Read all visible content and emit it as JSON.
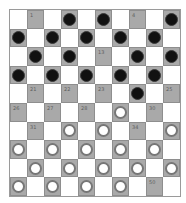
{
  "board": {
    "size": 10,
    "colors": {
      "light": "#ffffff",
      "dark": "#a9a9a9",
      "black_piece": "#111111",
      "white_piece": "#ffffff"
    },
    "squares": [
      {
        "n": 1,
        "piece": null
      },
      {
        "n": 2,
        "piece": "black"
      },
      {
        "n": 3,
        "piece": "black"
      },
      {
        "n": 4,
        "piece": null
      },
      {
        "n": 5,
        "piece": "black"
      },
      {
        "n": 6,
        "piece": "black"
      },
      {
        "n": 7,
        "piece": "black"
      },
      {
        "n": 8,
        "piece": "black"
      },
      {
        "n": 9,
        "piece": "black"
      },
      {
        "n": 10,
        "piece": "black"
      },
      {
        "n": 11,
        "piece": "black"
      },
      {
        "n": 12,
        "piece": "black"
      },
      {
        "n": 13,
        "piece": null
      },
      {
        "n": 14,
        "piece": "black"
      },
      {
        "n": 15,
        "piece": "black"
      },
      {
        "n": 16,
        "piece": "black"
      },
      {
        "n": 17,
        "piece": "black"
      },
      {
        "n": 18,
        "piece": "black"
      },
      {
        "n": 19,
        "piece": "black"
      },
      {
        "n": 20,
        "piece": "black"
      },
      {
        "n": 21,
        "piece": null
      },
      {
        "n": 22,
        "piece": null
      },
      {
        "n": 23,
        "piece": null
      },
      {
        "n": 24,
        "piece": "black"
      },
      {
        "n": 25,
        "piece": null
      },
      {
        "n": 26,
        "piece": null
      },
      {
        "n": 27,
        "piece": null
      },
      {
        "n": 28,
        "piece": null
      },
      {
        "n": 29,
        "piece": "white"
      },
      {
        "n": 30,
        "piece": null
      },
      {
        "n": 31,
        "piece": null
      },
      {
        "n": 32,
        "piece": "white"
      },
      {
        "n": 33,
        "piece": "white"
      },
      {
        "n": 34,
        "piece": null
      },
      {
        "n": 35,
        "piece": "white"
      },
      {
        "n": 36,
        "piece": "white"
      },
      {
        "n": 37,
        "piece": "white"
      },
      {
        "n": 38,
        "piece": "white"
      },
      {
        "n": 39,
        "piece": "white"
      },
      {
        "n": 40,
        "piece": "white"
      },
      {
        "n": 41,
        "piece": "white"
      },
      {
        "n": 42,
        "piece": "white"
      },
      {
        "n": 43,
        "piece": "white"
      },
      {
        "n": 44,
        "piece": "white"
      },
      {
        "n": 45,
        "piece": "white"
      },
      {
        "n": 46,
        "piece": "white"
      },
      {
        "n": 47,
        "piece": "white"
      },
      {
        "n": 48,
        "piece": "white"
      },
      {
        "n": 49,
        "piece": "white"
      },
      {
        "n": 50,
        "piece": null
      }
    ]
  }
}
